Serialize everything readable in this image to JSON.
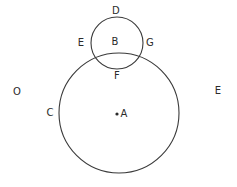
{
  "figure": {
    "type": "geometry-diagram",
    "background_color": "#ffffff",
    "stroke_color": "#3a3a3a",
    "text_color": "#2b2b2b",
    "labels": {
      "D": "D",
      "B": "B",
      "E_left": "E",
      "G": "G",
      "F": "F",
      "A": "A",
      "C": "C",
      "O": "O",
      "E_right": "E"
    },
    "point_marker": "•",
    "shapes": {
      "large_circle": {
        "cx": 119,
        "cy": 113,
        "r": 60
      },
      "small_circle": {
        "cx": 117,
        "cy": 43,
        "r": 26
      }
    },
    "label_positions": {
      "D": {
        "x": 116,
        "y": 11
      },
      "B": {
        "x": 115,
        "y": 42
      },
      "E_left": {
        "x": 81,
        "y": 43
      },
      "G": {
        "x": 150,
        "y": 43
      },
      "F": {
        "x": 117,
        "y": 76
      },
      "A": {
        "x": 124,
        "y": 114
      },
      "C": {
        "x": 50,
        "y": 113
      },
      "O": {
        "x": 17,
        "y": 92
      },
      "E_right": {
        "x": 218,
        "y": 91
      }
    },
    "center_dot": {
      "x": 117,
      "y": 114
    }
  }
}
